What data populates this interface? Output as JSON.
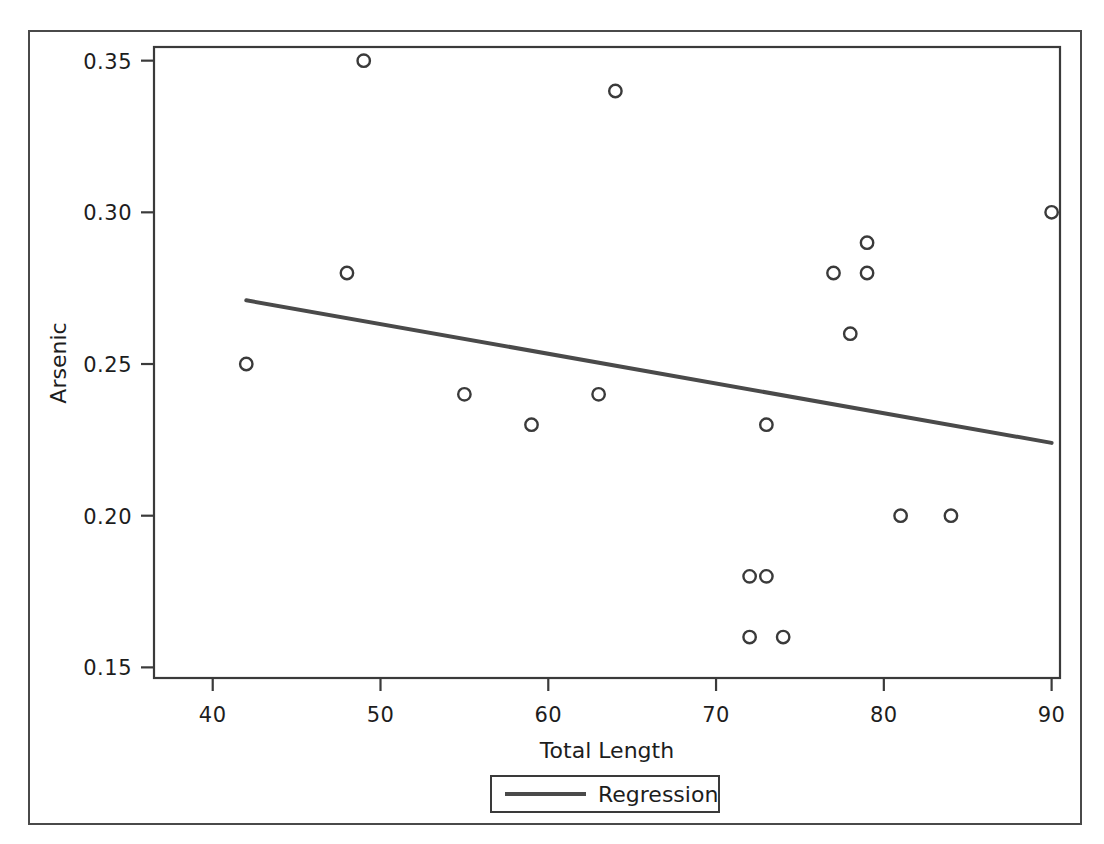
{
  "chart_data": {
    "type": "scatter",
    "title": "",
    "xlabel": "Total Length",
    "ylabel": "Arsenic",
    "xlim": [
      36.5,
      90.5
    ],
    "ylim": [
      0.1465,
      0.3545
    ],
    "xticks": [
      40,
      50,
      60,
      70,
      80,
      90
    ],
    "xtick_labels": [
      "40",
      "50",
      "60",
      "70",
      "80",
      "90"
    ],
    "yticks": [
      0.15,
      0.2,
      0.25,
      0.3,
      0.35
    ],
    "ytick_labels": [
      "0.15",
      "0.20",
      "0.25",
      "0.30",
      "0.35"
    ],
    "grid": false,
    "marker": "open-circle",
    "marker_color": "#3a3a3a",
    "line_color": "#4a4a4a",
    "points": [
      {
        "x": 42,
        "y": 0.25
      },
      {
        "x": 48,
        "y": 0.28
      },
      {
        "x": 49,
        "y": 0.35
      },
      {
        "x": 55,
        "y": 0.24
      },
      {
        "x": 59,
        "y": 0.23
      },
      {
        "x": 63,
        "y": 0.24
      },
      {
        "x": 64,
        "y": 0.34
      },
      {
        "x": 72,
        "y": 0.18
      },
      {
        "x": 72,
        "y": 0.16
      },
      {
        "x": 73,
        "y": 0.23
      },
      {
        "x": 73,
        "y": 0.18
      },
      {
        "x": 74,
        "y": 0.16
      },
      {
        "x": 77,
        "y": 0.28
      },
      {
        "x": 78,
        "y": 0.26
      },
      {
        "x": 79,
        "y": 0.29
      },
      {
        "x": 79,
        "y": 0.28
      },
      {
        "x": 81,
        "y": 0.2
      },
      {
        "x": 84,
        "y": 0.2
      },
      {
        "x": 90,
        "y": 0.3
      }
    ],
    "series": [
      {
        "name": "Regression",
        "type": "line",
        "x": [
          42,
          90
        ],
        "y": [
          0.271,
          0.224
        ]
      }
    ],
    "legend": {
      "position": "bottom",
      "entries": [
        {
          "label": "Regression",
          "marker": "line"
        }
      ]
    }
  }
}
